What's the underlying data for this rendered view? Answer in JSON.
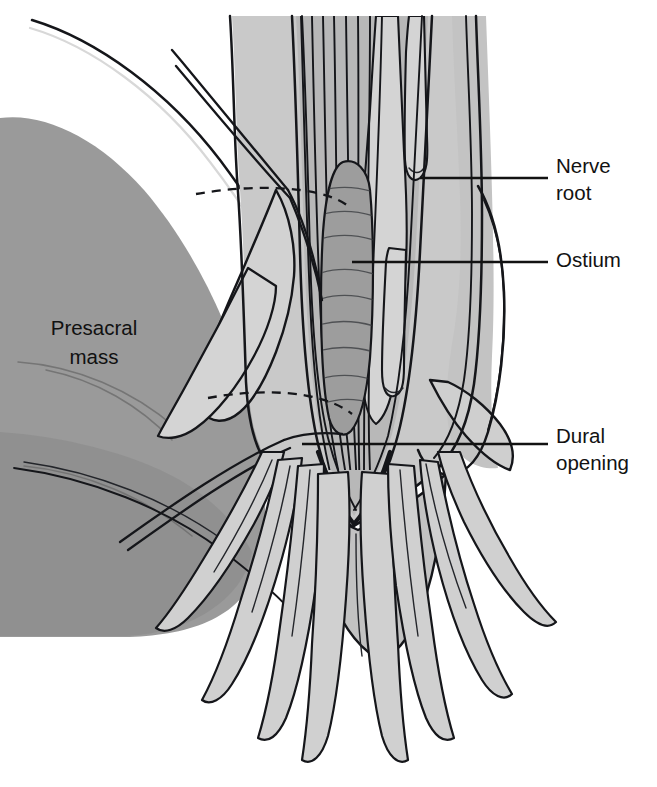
{
  "figure": {
    "kind": "medical-illustration",
    "background_color": "#ffffff",
    "view": "posterior operative view"
  },
  "palette": {
    "background": "#ffffff",
    "ink": "#15161a",
    "presacral_mass_fill": "#9a9a9a",
    "presacral_mass_shadow": "#8d8d8d",
    "dura_outer_fill": "#c9c9c9",
    "dura_inner_fill": "#b8b8b8",
    "dural_flap_fill": "#d2d2d2",
    "nerve_root_fill": "#d0d0d0",
    "ostium_fill": "#9d9d9d",
    "conus_fill": "#c2c2c2",
    "highlight": "#d8d8d8"
  },
  "labels": [
    {
      "id": "nerve-root",
      "text_lines": [
        "Nerve",
        "root"
      ],
      "text": "Nerve root",
      "side": "right",
      "text_x": 556,
      "text_y": 168,
      "line_height": 27,
      "leader": {
        "x1": 420,
        "y1": 178,
        "x2": 548,
        "y2": 178
      }
    },
    {
      "id": "ostium",
      "text_lines": [
        "Ostium"
      ],
      "text": "Ostium",
      "side": "right",
      "text_x": 556,
      "text_y": 262,
      "line_height": 27,
      "leader": {
        "x1": 352,
        "y1": 262,
        "x2": 548,
        "y2": 262
      }
    },
    {
      "id": "dural-opening",
      "text_lines": [
        "Dural",
        "opening"
      ],
      "text": "Dural opening",
      "side": "right",
      "text_x": 556,
      "text_y": 438,
      "line_height": 27,
      "leader": {
        "x1": 302,
        "y1": 444,
        "x2": 548,
        "y2": 444
      }
    },
    {
      "id": "presacral-mass",
      "text_lines": [
        "Presacral",
        "mass"
      ],
      "text": "Presacral mass",
      "side": "inside-left",
      "text_x": 94,
      "text_y": 330,
      "line_height": 29,
      "leader": null
    }
  ],
  "structures": [
    {
      "id": "presacral-mass",
      "name": "Presacral mass",
      "tone": "#9a9a9a"
    },
    {
      "id": "dural-sac",
      "name": "Dural sac",
      "tone": "#c9c9c9"
    },
    {
      "id": "dural-opening",
      "name": "Dural opening",
      "tone": "#b8b8b8"
    },
    {
      "id": "dural-flap-left",
      "name": "Retracted dural flap (left)",
      "tone": "#d2d2d2"
    },
    {
      "id": "dural-flap-right",
      "name": "Retracted dural flap (right)",
      "tone": "#d2d2d2"
    },
    {
      "id": "ostium",
      "name": "Ostium",
      "tone": "#9d9d9d"
    },
    {
      "id": "nerve-roots",
      "name": "Nerve roots / cauda equina",
      "tone": "#d0d0d0"
    },
    {
      "id": "conus",
      "name": "Conus / terminal sac",
      "tone": "#c2c2c2"
    },
    {
      "id": "sutures",
      "name": "Retraction sutures",
      "tone": "#15161a"
    }
  ],
  "counts": {
    "label_count": 4,
    "suture_threads": 4,
    "cauda_equina_strands": 11
  }
}
